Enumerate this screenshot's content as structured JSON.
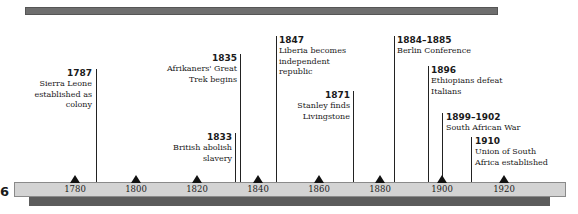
{
  "timeline": {
    "edge_glyph": "6",
    "ticks": [
      {
        "label": "1780",
        "x": 75
      },
      {
        "label": "1800",
        "x": 136
      },
      {
        "label": "1820",
        "x": 197
      },
      {
        "label": "1840",
        "x": 258
      },
      {
        "label": "1860",
        "x": 319
      },
      {
        "label": "1880",
        "x": 380
      },
      {
        "label": "1900",
        "x": 442
      },
      {
        "label": "1920",
        "x": 504
      }
    ],
    "events": [
      {
        "year": "1787",
        "text_lines": [
          "Sierra Leone",
          "established as",
          "colony"
        ],
        "side": "left"
      },
      {
        "year": "1833",
        "text_lines": [
          "British abolish",
          "slavery"
        ],
        "side": "left"
      },
      {
        "year": "1835",
        "text_lines": [
          "Afrikaners' Great",
          "Trek begins"
        ],
        "side": "left"
      },
      {
        "year": "1847",
        "text_lines": [
          "Liberia becomes",
          "independent",
          "republic"
        ],
        "side": "right"
      },
      {
        "year": "1871",
        "text_lines": [
          "Stanley finds",
          "Livingstone"
        ],
        "side": "left"
      },
      {
        "year": "1884–1885",
        "text_lines": [
          "Berlin Conference"
        ],
        "side": "right"
      },
      {
        "year": "1896",
        "text_lines": [
          "Ethiopians defeat",
          "Italians"
        ],
        "side": "right"
      },
      {
        "year": "1899–1902",
        "text_lines": [
          "South African War"
        ],
        "side": "right"
      },
      {
        "year": "1910",
        "text_lines": [
          "Union of South",
          "Africa established"
        ],
        "side": "right"
      }
    ]
  }
}
